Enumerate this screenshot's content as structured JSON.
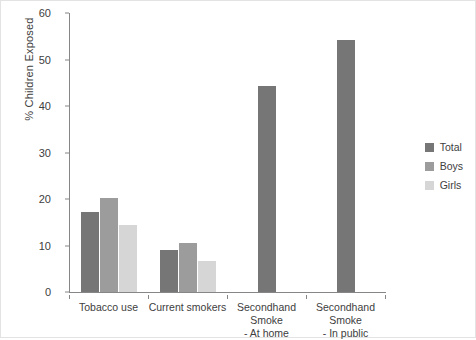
{
  "chart_data": {
    "type": "bar",
    "title": "",
    "xlabel": "",
    "ylabel": "% Children Exposed",
    "ylim": [
      0,
      60
    ],
    "ytick_step": 10,
    "yticks": [
      "0",
      "10",
      "20",
      "30",
      "40",
      "50",
      "60"
    ],
    "grid": false,
    "legend_position": "right",
    "categories": [
      "Tobacco use",
      "Current smokers",
      "Secondhand Smoke\n- At home",
      "Secondhand Smoke\n- In public"
    ],
    "category_lines": [
      [
        "Tobacco use",
        ""
      ],
      [
        "Current smokers",
        ""
      ],
      [
        "Secondhand Smoke",
        "- At home"
      ],
      [
        "Secondhand Smoke",
        "- In public"
      ]
    ],
    "series": [
      {
        "name": "Total",
        "color": "#767676",
        "values": [
          17.3,
          9.0,
          44.2,
          54.2
        ]
      },
      {
        "name": "Boys",
        "color": "#9c9c9c",
        "values": [
          20.2,
          10.6,
          null,
          null
        ]
      },
      {
        "name": "Girls",
        "color": "#d6d6d6",
        "values": [
          14.4,
          6.7,
          null,
          null
        ]
      }
    ]
  },
  "legend": {
    "items": [
      {
        "label": "Total",
        "color": "#767676"
      },
      {
        "label": "Boys",
        "color": "#9c9c9c"
      },
      {
        "label": "Girls",
        "color": "#d6d6d6"
      }
    ]
  }
}
